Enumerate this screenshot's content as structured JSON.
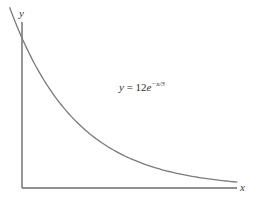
{
  "chart_data": {
    "type": "line",
    "title": "",
    "xlabel": "x",
    "ylabel": "y",
    "annotation": {
      "lhs": "y",
      "equals": "=",
      "coefficient": "12",
      "base": "e",
      "exponent": "−x/3",
      "full_text": "y = 12e^(-x/3)"
    },
    "function": {
      "a": 12,
      "k": 3,
      "form": "y = a * exp(-x / k)"
    },
    "xlim": [
      0,
      9.7
    ],
    "ylim": [
      0,
      12
    ],
    "grid": false,
    "legend": "none",
    "ticks": {
      "x": [],
      "y": []
    },
    "series": [
      {
        "name": "y = 12e^(-x/3)",
        "x": [
          -0.56,
          0,
          1,
          2,
          3,
          4,
          5,
          6,
          7,
          8,
          9,
          9.7
        ],
        "y": [
          14.2,
          12.0,
          8.6,
          6.16,
          4.41,
          3.16,
          2.27,
          1.62,
          1.16,
          0.83,
          0.6,
          0.47
        ]
      }
    ]
  },
  "layout": {
    "origin_px": [
      22,
      188
    ],
    "x_axis_end_px": 237,
    "y_axis_top_px": 22,
    "px_per_x_unit": 22.2,
    "px_per_y_unit": 12.5
  },
  "axes": {
    "x_label": "x",
    "y_label": "y"
  }
}
